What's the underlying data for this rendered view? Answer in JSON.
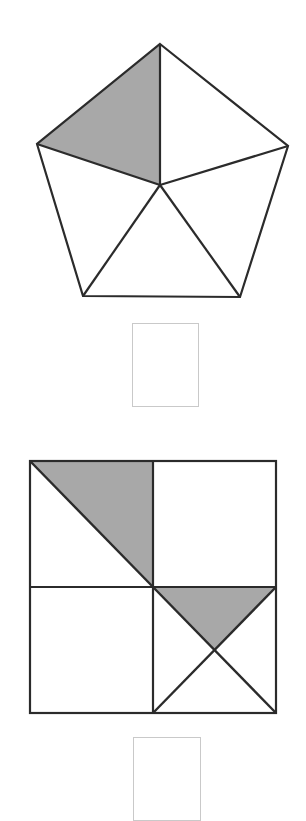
{
  "page": {
    "width": 306,
    "height": 803,
    "background_color": "#ffffff"
  },
  "colors": {
    "stroke": "#2b2b2b",
    "shaded_fill": "#a8a8a8",
    "unshaded_fill": "#ffffff",
    "answer_box_border": "#c9c9c9",
    "background": "#ffffff"
  },
  "figures": [
    {
      "id": "pentagon-figure",
      "name": "regular-pentagon-divided-into-five-triangles",
      "shape": "pentagon",
      "total_parts": 5,
      "shaded_parts": 1,
      "fraction_shaded": "1/5",
      "stroke_width": 2,
      "vertices": [
        {
          "label": "top",
          "x": 160,
          "y": 44
        },
        {
          "label": "right",
          "x": 288,
          "y": 146
        },
        {
          "label": "bottom-right",
          "x": 240,
          "y": 297
        },
        {
          "label": "bottom-left",
          "x": 83,
          "y": 296
        },
        {
          "label": "left",
          "x": 37,
          "y": 144
        }
      ],
      "center": {
        "x": 160,
        "y": 185
      },
      "regions": [
        {
          "name": "triangle-top-left",
          "points": "160,44 37,144 160,185",
          "shaded": true
        },
        {
          "name": "triangle-top-right",
          "points": "160,44 288,146 160,185",
          "shaded": false
        },
        {
          "name": "triangle-right",
          "points": "288,146 240,297 160,185",
          "shaded": false
        },
        {
          "name": "triangle-bottom",
          "points": "240,297 83,296 160,185",
          "shaded": false
        },
        {
          "name": "triangle-left",
          "points": "83,296 37,144 160,185",
          "shaded": false
        }
      ]
    },
    {
      "id": "square-figure",
      "name": "square-divided-into-quadrants-with-diagonals",
      "shape": "square",
      "total_parts": 8,
      "shaded_parts": 2,
      "fraction_shaded": "2/8",
      "stroke_width": 2,
      "bounds": {
        "left": 30,
        "top": 461,
        "right": 276,
        "bottom": 713,
        "width": 246,
        "height": 252
      },
      "center": {
        "x": 153,
        "y": 587
      },
      "regions": [
        {
          "name": "top-left-quadrant-upper-right-triangle",
          "points": "30,461 153,461 153,587",
          "shaded": true
        },
        {
          "name": "top-left-quadrant-lower-left-triangle",
          "points": "30,461 153,587 30,587",
          "shaded": false
        },
        {
          "name": "top-right-quadrant",
          "points": "153,461 276,461 276,587 153,587",
          "shaded": false
        },
        {
          "name": "bottom-left-quadrant",
          "points": "30,587 153,587 153,713 30,713",
          "shaded": false
        },
        {
          "name": "bottom-right-quadrant-top-triangle",
          "points": "153,587 276,587 214.5,650",
          "shaded": true
        },
        {
          "name": "bottom-right-quadrant-right-triangle",
          "points": "276,587 276,713 214.5,650",
          "shaded": false
        },
        {
          "name": "bottom-right-quadrant-bottom-triangle",
          "points": "276,713 153,713 214.5,650",
          "shaded": false
        },
        {
          "name": "bottom-right-quadrant-left-triangle",
          "points": "153,713 153,587 214.5,650",
          "shaded": false
        }
      ],
      "internal_lines": [
        {
          "name": "horizontal-midline",
          "x1": 30,
          "y1": 587,
          "x2": 276,
          "y2": 587
        },
        {
          "name": "vertical-midline",
          "x1": 153,
          "y1": 461,
          "x2": 153,
          "y2": 713
        },
        {
          "name": "top-left-diagonal",
          "x1": 30,
          "y1": 461,
          "x2": 153,
          "y2": 587
        },
        {
          "name": "bottom-right-diagonal-down",
          "x1": 153,
          "y1": 587,
          "x2": 276,
          "y2": 713
        },
        {
          "name": "bottom-right-diagonal-up",
          "x1": 276,
          "y1": 587,
          "x2": 153,
          "y2": 713
        }
      ]
    }
  ],
  "answer_boxes": [
    {
      "id": "answer-box-1",
      "name": "answer-box-pentagon",
      "value": "",
      "placeholder": "",
      "x": 132,
      "y": 323,
      "width": 67,
      "height": 84,
      "border_color": "#c9c9c9"
    },
    {
      "id": "answer-box-2",
      "name": "answer-box-square",
      "value": "",
      "placeholder": "",
      "x": 133,
      "y": 737,
      "width": 68,
      "height": 84,
      "border_color": "#c9c9c9"
    }
  ]
}
